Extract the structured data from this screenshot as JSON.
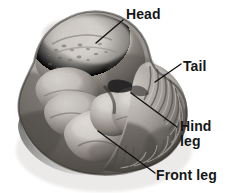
{
  "figure": {
    "kind": "labeled-photograph",
    "background_color": "#ffffff",
    "width": 227,
    "height": 193
  },
  "specimen": {
    "name": "embryo-photograph",
    "description": "grayscale photograph of a C-shaped curled embryo",
    "tones": {
      "highlight": "#e8e6e3",
      "light": "#c9c5c0",
      "mid": "#9b9691",
      "shade": "#6e6a66",
      "dark": "#3e3b38",
      "deepest": "#232120"
    }
  },
  "annotations": {
    "line_color": "#111111",
    "line_width": 1.4,
    "items": [
      {
        "id": "head",
        "label": "Head",
        "x1": 96,
        "y1": 43,
        "x2": 123,
        "y2": 20
      },
      {
        "id": "tail",
        "label": "Tail",
        "x1": 155,
        "y1": 82,
        "x2": 181,
        "y2": 64
      },
      {
        "id": "hind-leg",
        "label": "Hind\nleg",
        "line1": "Hind",
        "line2": "leg",
        "x1": 131,
        "y1": 93,
        "x2": 177,
        "y2": 127
      },
      {
        "id": "front-leg",
        "label": "Front leg",
        "x1": 98,
        "y1": 131,
        "x2": 155,
        "y2": 173
      }
    ]
  }
}
